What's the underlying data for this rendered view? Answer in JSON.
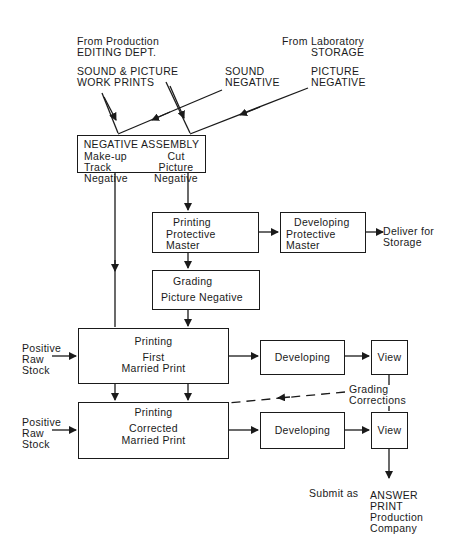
{
  "diagram": {
    "sources": {
      "production": {
        "line1": "From Production",
        "line2": "EDITING DEPT."
      },
      "laboratory": {
        "line1": "From Laboratory",
        "line2": "STORAGE"
      }
    },
    "inputs": {
      "work_prints": {
        "line1": "SOUND & PICTURE",
        "line2": "WORK PRINTS"
      },
      "sound_negative": {
        "line1": "SOUND",
        "line2": "NEGATIVE"
      },
      "picture_negative": {
        "line1": "PICTURE",
        "line2": "NEGATIVE"
      }
    },
    "nodes": {
      "negative_assembly": {
        "title": "NEGATIVE ASSEMBLY",
        "left": {
          "line1": "Make-up",
          "line2": "Track",
          "line3": "Negative"
        },
        "right": {
          "line1": "Cut",
          "line2": "Picture",
          "line3": "Negative"
        }
      },
      "printing_protective_master": {
        "line1": "Printing",
        "line2": "Protective",
        "line3": "Master"
      },
      "developing_protective_master": {
        "line1": "Developing",
        "line2": "Protective",
        "line3": "Master"
      },
      "deliver_storage": {
        "line1": "Deliver for",
        "line2": "Storage"
      },
      "grading_picture_negative": {
        "line1": "Grading",
        "line2": "Picture Negative"
      },
      "printing_first_married": {
        "line1": "Printing",
        "line2": "First",
        "line3": "Married Print"
      },
      "developing_1": {
        "label": "Developing"
      },
      "view_1": {
        "label": "View"
      },
      "grading_corrections": {
        "line1": "Grading",
        "line2": "Corrections"
      },
      "printing_corrected_married": {
        "line1": "Printing",
        "line2": "Corrected",
        "line3": "Married Print"
      },
      "developing_2": {
        "label": "Developing"
      },
      "view_2": {
        "label": "View"
      },
      "raw_stock_1": {
        "line1": "Positive",
        "line2": "Raw",
        "line3": "Stock"
      },
      "raw_stock_2": {
        "line1": "Positive",
        "line2": "Raw",
        "line3": "Stock"
      },
      "submit": {
        "prefix": "Submit as",
        "line1": "ANSWER",
        "line2": "PRINT",
        "line3": "Production",
        "line4": "Company"
      }
    },
    "colors": {
      "ink": "#1a1a1a",
      "background": "#ffffff"
    }
  }
}
